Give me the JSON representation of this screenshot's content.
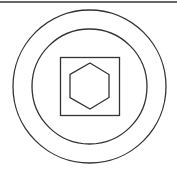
{
  "diagram": {
    "stroke_color": "#333333",
    "background": "#ffffff",
    "top_rule": {
      "x1": 0,
      "y1": 2,
      "x2": 177,
      "y2": 2
    },
    "outer_circle": {
      "cx": 89.5,
      "cy": 86.5,
      "r": 76.5
    },
    "inner_circle": {
      "cx": 89.5,
      "cy": 86.5,
      "r": 57.5
    },
    "square": {
      "x": 60.5,
      "y": 57.5,
      "width": 59,
      "height": 58
    },
    "hexagon": {
      "points": "90,63 109,74.5 109,97.5 90,109 70,97.5 70,74.5"
    }
  }
}
